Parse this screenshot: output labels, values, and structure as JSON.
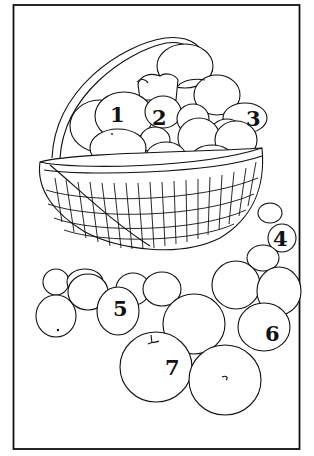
{
  "illustration": {
    "subject": "basket of apples line drawing",
    "frame_color": "#111111",
    "background": "#ffffff",
    "labels": [
      {
        "id": 1,
        "text": "1",
        "x": 110,
        "y": 122
      },
      {
        "id": 2,
        "text": "2",
        "x": 152,
        "y": 125
      },
      {
        "id": 3,
        "text": "3",
        "x": 246,
        "y": 126
      },
      {
        "id": 4,
        "text": "4",
        "x": 273,
        "y": 246
      },
      {
        "id": 5,
        "text": "5",
        "x": 113,
        "y": 316
      },
      {
        "id": 6,
        "text": "6",
        "x": 265,
        "y": 341
      },
      {
        "id": 7,
        "text": "7",
        "x": 165,
        "y": 375
      }
    ]
  }
}
